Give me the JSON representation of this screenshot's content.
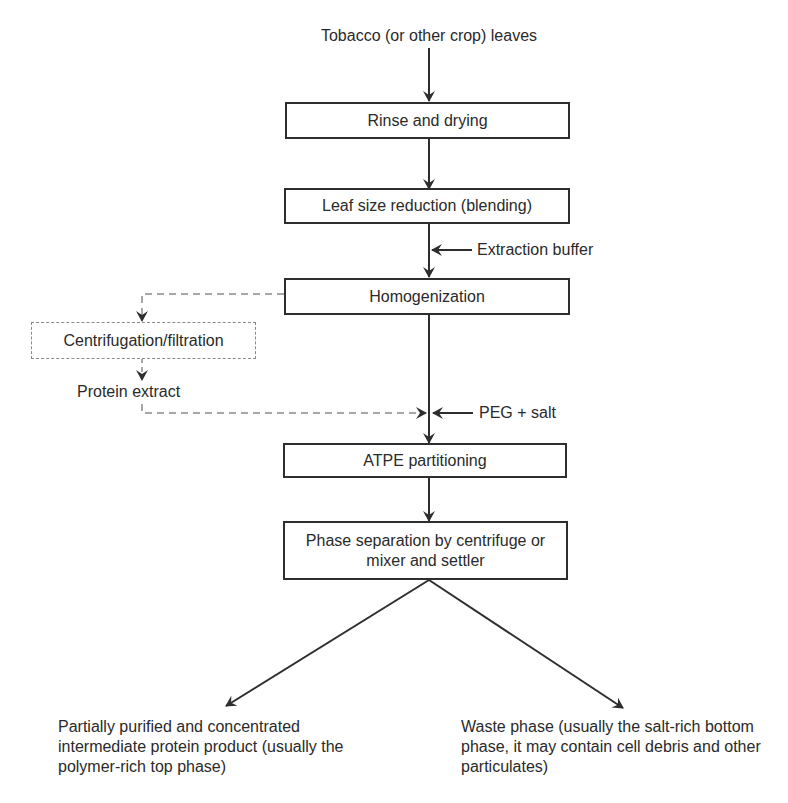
{
  "diagram": {
    "type": "flowchart",
    "input": "Tobacco (or other crop) leaves",
    "steps": [
      {
        "id": "rinse",
        "label": "Rinse and drying"
      },
      {
        "id": "leaf_size",
        "label": "Leaf size reduction (blending)"
      },
      {
        "id": "homogenization",
        "label": "Homogenization"
      },
      {
        "id": "atpe",
        "label": "ATPE partitioning"
      },
      {
        "id": "phase_sep",
        "label": "Phase separation by centrifuge or mixer and settler"
      }
    ],
    "optional_branch": {
      "step": "Centrifugation/filtration",
      "output": "Protein extract"
    },
    "side_inputs": {
      "extraction_buffer": "Extraction buffer",
      "peg_salt": "PEG + salt"
    },
    "outputs": {
      "product": "Partially purified and concentrated intermediate protein product (usually the polymer-rich top phase)",
      "waste": "Waste phase (usually the salt-rich bottom phase, it may contain cell debris and other particulates)"
    },
    "edges": [
      [
        "input",
        "rinse"
      ],
      [
        "rinse",
        "leaf_size"
      ],
      [
        "leaf_size",
        "homogenization"
      ],
      [
        "extraction_buffer",
        "leaf_size->homogenization"
      ],
      [
        "homogenization",
        "Centrifugation/filtration",
        "dashed"
      ],
      [
        "Centrifugation/filtration",
        "Protein extract",
        "dashed"
      ],
      [
        "Protein extract",
        "homogenization->atpe",
        "dashed"
      ],
      [
        "homogenization",
        "atpe"
      ],
      [
        "peg_salt",
        "homogenization->atpe"
      ],
      [
        "atpe",
        "phase_sep"
      ],
      [
        "phase_sep",
        "product"
      ],
      [
        "phase_sep",
        "waste"
      ]
    ]
  }
}
